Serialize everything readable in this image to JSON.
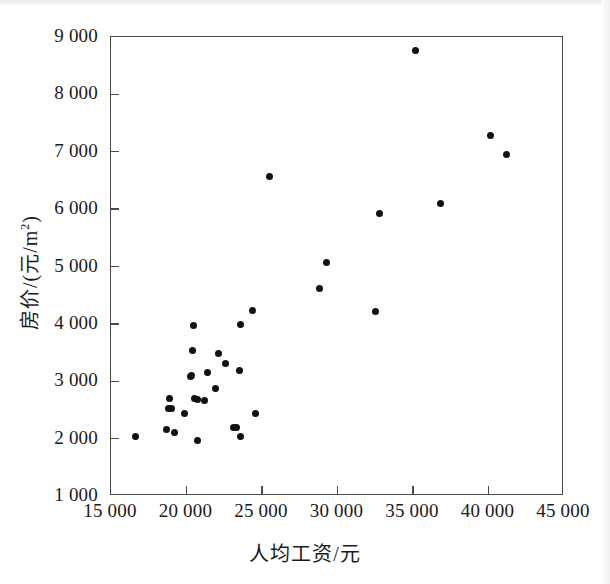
{
  "figure": {
    "type": "scatter-plot-figure",
    "background_color": "#ffffff",
    "frame_color": "#4b4b4b",
    "point_color": "#111111"
  },
  "chart_data": {
    "type": "scatter",
    "title": "",
    "subtitle": "",
    "xlabel": "人均工资/元",
    "ylabel_text": "房价/(元/m",
    "ylabel_sup": "2",
    "ylabel_tail": ")",
    "ylabel_full": "房价/(元/m2)",
    "xlim": [
      15000,
      45000
    ],
    "ylim": [
      1000,
      9000
    ],
    "grid": false,
    "legend": "none",
    "xticks": [
      15000,
      20000,
      25000,
      30000,
      35000,
      40000,
      45000
    ],
    "xtick_labels": [
      "15 000",
      "20 000",
      "25 000",
      "30 000",
      "35 000",
      "40 000",
      "45 000"
    ],
    "yticks": [
      1000,
      2000,
      3000,
      4000,
      5000,
      6000,
      7000,
      8000,
      9000
    ],
    "ytick_labels": [
      "1 000",
      "2 000",
      "3 000",
      "4 000",
      "5 000",
      "6 000",
      "7 000",
      "8 000",
      "9 000"
    ],
    "series": [
      {
        "name": "城市样本",
        "marker": "circle",
        "color": "#111111",
        "points": [
          {
            "x": 16650,
            "y": 2030
          },
          {
            "x": 18700,
            "y": 2160
          },
          {
            "x": 18800,
            "y": 2520
          },
          {
            "x": 18900,
            "y": 2700
          },
          {
            "x": 19000,
            "y": 2530
          },
          {
            "x": 19200,
            "y": 2110
          },
          {
            "x": 19900,
            "y": 2430
          },
          {
            "x": 20250,
            "y": 3080
          },
          {
            "x": 20300,
            "y": 3100
          },
          {
            "x": 20400,
            "y": 3540
          },
          {
            "x": 20450,
            "y": 3980
          },
          {
            "x": 20500,
            "y": 2700
          },
          {
            "x": 20700,
            "y": 2690
          },
          {
            "x": 20750,
            "y": 1960
          },
          {
            "x": 21200,
            "y": 2670
          },
          {
            "x": 21400,
            "y": 3160
          },
          {
            "x": 21900,
            "y": 2870
          },
          {
            "x": 22150,
            "y": 3490
          },
          {
            "x": 22600,
            "y": 3310
          },
          {
            "x": 23100,
            "y": 2200
          },
          {
            "x": 23300,
            "y": 2190
          },
          {
            "x": 23500,
            "y": 3190
          },
          {
            "x": 23550,
            "y": 3990
          },
          {
            "x": 23600,
            "y": 2030
          },
          {
            "x": 24350,
            "y": 4230
          },
          {
            "x": 24600,
            "y": 2430
          },
          {
            "x": 25500,
            "y": 6560
          },
          {
            "x": 28800,
            "y": 4610
          },
          {
            "x": 29250,
            "y": 5070
          },
          {
            "x": 32500,
            "y": 4220
          },
          {
            "x": 32750,
            "y": 5920
          },
          {
            "x": 35150,
            "y": 8760
          },
          {
            "x": 36800,
            "y": 6090
          },
          {
            "x": 40100,
            "y": 7280
          },
          {
            "x": 41200,
            "y": 6950
          }
        ]
      }
    ]
  }
}
